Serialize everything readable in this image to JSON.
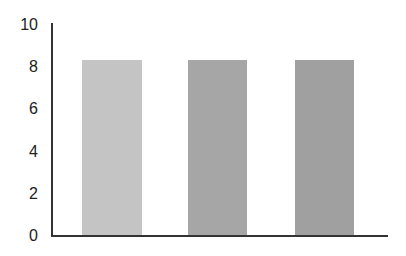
{
  "chart_data": {
    "type": "bar",
    "title": "",
    "xlabel": "",
    "ylabel": "",
    "categories": [
      "",
      "",
      ""
    ],
    "values": [
      8.3,
      8.3,
      8.3
    ],
    "bar_colors": [
      "#c4c4c4",
      "#a6a6a6",
      "#a0a0a0"
    ],
    "ylim": [
      0,
      10
    ],
    "yticks": [
      0,
      2,
      4,
      6,
      8,
      10
    ],
    "ytick_labels": [
      "0",
      "2",
      "4",
      "6",
      "8",
      "10"
    ],
    "grid": false,
    "legend": null
  }
}
